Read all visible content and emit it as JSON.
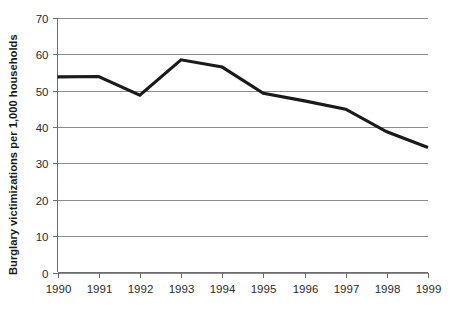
{
  "chart_data": {
    "type": "line",
    "title": "",
    "subtitle": "",
    "xlabel": "",
    "ylabel": "Burglary victimizations per 1,000 households",
    "categories": [
      "1990",
      "1991",
      "1992",
      "1993",
      "1994",
      "1995",
      "1996",
      "1997",
      "1998",
      "1999"
    ],
    "x": [
      1990,
      1991,
      1992,
      1993,
      1994,
      1995,
      1996,
      1997,
      1998,
      1999
    ],
    "values": [
      53.8,
      53.9,
      48.8,
      58.5,
      56.5,
      49.3,
      47.2,
      44.9,
      38.7,
      34.4
    ],
    "series": [
      {
        "name": "Burglary victimizations per 1,000 households",
        "values": [
          53.8,
          53.9,
          48.8,
          58.5,
          56.5,
          49.3,
          47.2,
          44.9,
          38.7,
          34.4
        ]
      }
    ],
    "ylim": [
      0,
      70
    ],
    "xlim": [
      1990,
      1999
    ],
    "y_ticks": [
      0,
      10,
      20,
      30,
      40,
      50,
      60,
      70
    ],
    "y_tick_labels": [
      "0",
      "10",
      "20",
      "30",
      "40",
      "50",
      "60",
      "70"
    ],
    "x_ticks": [
      1990,
      1991,
      1992,
      1993,
      1994,
      1995,
      1996,
      1997,
      1998,
      1999
    ],
    "x_tick_labels": [
      "1990",
      "1991",
      "1992",
      "1993",
      "1994",
      "1995",
      "1996",
      "1997",
      "1998",
      "1999"
    ],
    "grid": true,
    "grid_axis": "y",
    "legend": false,
    "legend_position": "none",
    "annotations": [],
    "colors": {
      "line": "#1a1a1a",
      "grid": "#8c8c8c",
      "axis": "#6e6e6e",
      "text": "#2b2b2b",
      "axis_label_text": "#1a1a1a",
      "background": "#ffffff"
    }
  }
}
